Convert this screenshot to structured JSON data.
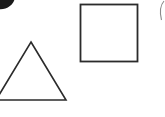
{
  "canvas": {
    "width": 165,
    "height": 117,
    "background_color": "#ffffff",
    "title": "Geometric Shapes"
  },
  "palette": {
    "stroke_color": "#2b2b2b",
    "blob_fill": "#1a1a1a",
    "faint_arc_color": "#8a8a8a",
    "fill_color": "none"
  },
  "shapes": [
    {
      "name": "triangle",
      "label": "Triangle",
      "kind": "triangle",
      "fill": "none",
      "stroke": "#2b2b2b",
      "stroke_width": 1.6,
      "clipped": true,
      "clipped_edge": "left",
      "points": "31,42 66,100 -4,100",
      "apex_x": 31,
      "apex_y": 42,
      "base_y": 100,
      "base_right_x": 66,
      "base_left_x": -4
    },
    {
      "name": "square",
      "label": "Square",
      "kind": "rect",
      "fill": "none",
      "stroke": "#2b2b2b",
      "stroke_width": 1.8,
      "clipped": false,
      "x": 80.5,
      "y": 4.5,
      "width": 57,
      "height": 57
    },
    {
      "name": "corner-blob",
      "label": "Dark Blob",
      "kind": "ellipse",
      "fill": "#1a1a1a",
      "stroke": "none",
      "stroke_width": 0,
      "clipped": true,
      "clipped_edge": "top-left",
      "cx": 2,
      "cy": -2,
      "rx": 13,
      "ry": 11,
      "rotation": -18
    },
    {
      "name": "edge-arc",
      "label": "Edge Arc",
      "kind": "path",
      "fill": "none",
      "stroke": "#8a8a8a",
      "stroke_width": 1.1,
      "clipped": true,
      "clipped_edge": "right",
      "d": "M 164 1 C 160.5 5 159.5 12 161.5 20"
    }
  ],
  "accessibility": {
    "alt_text": "White background with a line-drawn triangle at lower left and a line-drawn square at upper right"
  }
}
